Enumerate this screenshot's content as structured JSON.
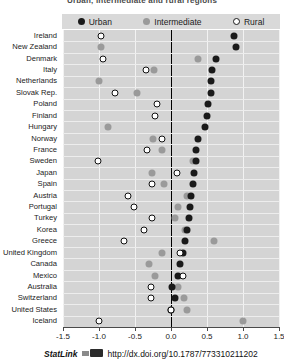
{
  "header": {
    "clipped_title": "Urban, intermediate and rural regions"
  },
  "legend": {
    "items": [
      {
        "key": "urban",
        "label": "Urban",
        "color": "#1a1a1a"
      },
      {
        "key": "intermediate",
        "label": "Intermediate",
        "color": "#9a9a9a"
      },
      {
        "key": "rural",
        "label": "Rural",
        "color": "#ffffff"
      }
    ]
  },
  "footer": {
    "statlink_label": "StatLink",
    "statlink_icon": "statlink-icon",
    "url": "http://dx.doi.org/10.1787/773310211202"
  },
  "chart_data": {
    "type": "scatter",
    "title": "",
    "xlabel": "",
    "ylabel": "",
    "xlim": [
      -1.5,
      1.5
    ],
    "xticks": [
      -1.5,
      -1.0,
      -0.5,
      0.0,
      0.5,
      1.0,
      1.5
    ],
    "xticklabels": [
      "-1.5",
      "-1.0",
      "-0.5",
      "0.0",
      "0.5",
      "1.0",
      "1.5"
    ],
    "grid": true,
    "legend_position": "top",
    "categories": [
      "Ireland",
      "New Zealand",
      "Denmark",
      "Italy",
      "Netherlands",
      "Slovak Rep.",
      "Poland",
      "Finland",
      "Hungary",
      "Norway",
      "France",
      "Sweden",
      "Japan",
      "Spain",
      "Austria",
      "Portugal",
      "Turkey",
      "Korea",
      "Greece",
      "United Kingdom",
      "Canada",
      "Mexico",
      "Australia",
      "Switzerland",
      "United States",
      "Iceland"
    ],
    "series": [
      {
        "name": "Urban",
        "color": "#1a1a1a",
        "values": [
          0.87,
          0.9,
          0.63,
          0.57,
          0.55,
          0.55,
          0.52,
          0.5,
          0.47,
          0.38,
          0.35,
          0.35,
          0.32,
          0.3,
          0.28,
          0.27,
          0.25,
          0.22,
          0.2,
          0.17,
          0.13,
          0.1,
          0.02,
          0.05,
          0.0,
          null
        ]
      },
      {
        "name": "Intermediate",
        "color": "#9a9a9a",
        "values": [
          null,
          -0.97,
          0.37,
          -0.23,
          -1.0,
          -0.47,
          null,
          null,
          -0.87,
          -0.25,
          -0.13,
          0.3,
          -0.27,
          -0.1,
          0.22,
          0.1,
          0.05,
          0.2,
          0.6,
          -0.12,
          -0.3,
          -0.22,
          0.1,
          0.18,
          0.22,
          1.0
        ]
      },
      {
        "name": "Rural",
        "color": "#ffffff",
        "values": [
          -0.97,
          null,
          -0.95,
          -0.35,
          null,
          -0.78,
          -0.2,
          -0.22,
          null,
          -0.12,
          -0.33,
          -1.02,
          0.08,
          -0.27,
          -0.6,
          -0.52,
          -0.27,
          -0.38,
          -0.65,
          0.12,
          null,
          0.17,
          -0.28,
          -0.28,
          0.0,
          -1.0
        ]
      }
    ]
  }
}
